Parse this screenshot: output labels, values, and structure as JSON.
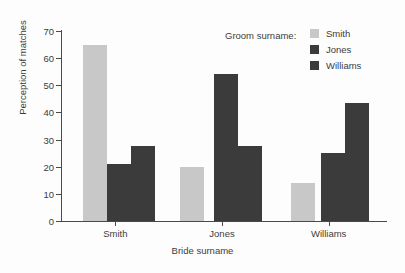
{
  "chart_data": {
    "type": "bar",
    "title": "",
    "subtitle": "",
    "xlabel": "Bride surname",
    "ylabel": "Perception of matches",
    "categories": [
      "Smith",
      "Jones",
      "Williams"
    ],
    "series": [
      {
        "name": "Smith",
        "values": [
          65,
          20,
          14
        ],
        "color": "#c8c8c8"
      },
      {
        "name": "Jones",
        "values": [
          21,
          54,
          25
        ],
        "color": "#3b3b3b"
      },
      {
        "name": "Williams",
        "values": [
          27.5,
          27.5,
          43.5
        ],
        "color": "#3b3b3b"
      }
    ],
    "ylim": [
      0,
      70
    ],
    "yticks": [
      0,
      10,
      20,
      30,
      40,
      50,
      60,
      70
    ],
    "ytick_labels": [
      "0",
      "10",
      "20",
      "30",
      "40",
      "50",
      "60",
      "70"
    ],
    "grid": false,
    "legend_position": "top-right",
    "legend_title": "Groom surname:"
  },
  "axes": {
    "y_title": "Perception of matches",
    "x_title": "Bride surname"
  },
  "legend": {
    "title": "Groom surname:",
    "entries": [
      {
        "label": "Smith",
        "color": "#c8c8c8"
      },
      {
        "label": "Jones",
        "color": "#3b3b3b"
      },
      {
        "label": "Williams",
        "color": "#3b3b3b"
      }
    ]
  },
  "colors": {
    "light_gray": "#c8c8c8",
    "dark_gray": "#3b3b3b",
    "axis": "#4a4a4a",
    "text": "#3c3c3c",
    "background": "#fdfdfd"
  }
}
